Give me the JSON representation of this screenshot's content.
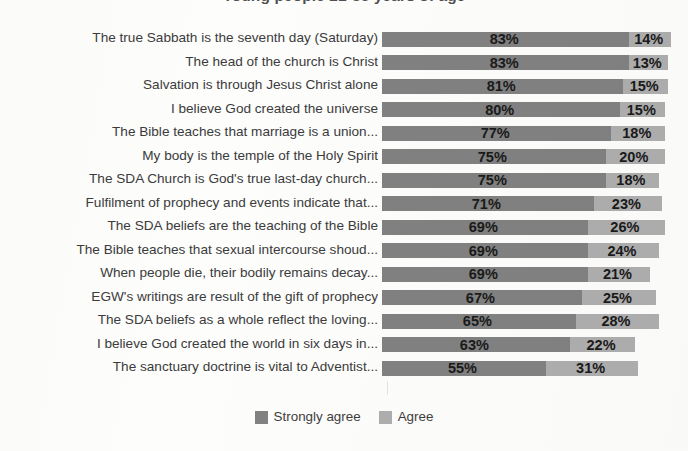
{
  "chart_title": "Young people 21-35 years of age",
  "legend": {
    "position": "bottom-center",
    "items": [
      {
        "label": "Strongly agree",
        "color": "#818181",
        "swatch_name": "legend-swatch-strongly-agree"
      },
      {
        "label": "Agree",
        "color": "#aeaeae",
        "swatch_name": "legend-swatch-agree"
      }
    ]
  },
  "colors": {
    "strongly_agree": "#818181",
    "agree": "#aeaeae",
    "label_text": "#3b3b3b",
    "value_text": "#1a1a1a",
    "background": "#fdfdfc"
  },
  "chart_data": {
    "type": "bar",
    "orientation": "horizontal",
    "stacked": true,
    "title": "Young people 21-35 years of age",
    "xlabel": "",
    "ylabel": "",
    "xlim": [
      0,
      100
    ],
    "grid": false,
    "legend_position": "bottom-center",
    "value_suffix": "%",
    "categories": [
      "The true Sabbath is the seventh day (Saturday)",
      "The head of the church is Christ",
      "Salvation is through Jesus Christ alone",
      "I believe God created the universe",
      "The Bible teaches that marriage is a union...",
      "My body is the temple of the Holy Spirit",
      "The SDA Church is God's true last-day church...",
      "Fulfilment of prophecy and events indicate that...",
      "The SDA beliefs are the teaching of the Bible",
      "The Bible teaches that sexual intercourse shoud...",
      "When people die, their bodily remains decay...",
      "EGW's writings are result of the gift of prophecy",
      "The SDA beliefs  as a whole reflect the loving...",
      "I believe God created the world in six days in...",
      "The sanctuary doctrine is vital to Adventist..."
    ],
    "series": [
      {
        "name": "Strongly agree",
        "color": "#818181",
        "values": [
          83,
          83,
          81,
          80,
          77,
          75,
          75,
          71,
          69,
          69,
          69,
          67,
          65,
          63,
          55
        ],
        "labels": [
          "83%",
          "83%",
          "81%",
          "80%",
          "77%",
          "75%",
          "75%",
          "71%",
          "69%",
          "69%",
          "69%",
          "67%",
          "65%",
          "63%",
          "55%"
        ]
      },
      {
        "name": "Agree",
        "color": "#aeaeae",
        "values": [
          14,
          13,
          15,
          15,
          18,
          20,
          18,
          23,
          26,
          24,
          21,
          25,
          28,
          22,
          31
        ],
        "labels": [
          "14%",
          "13%",
          "15%",
          "15%",
          "18%",
          "20%",
          "18%",
          "23%",
          "26%",
          "24%",
          "21%",
          "25%",
          "28%",
          "22%",
          "31%"
        ]
      }
    ]
  }
}
